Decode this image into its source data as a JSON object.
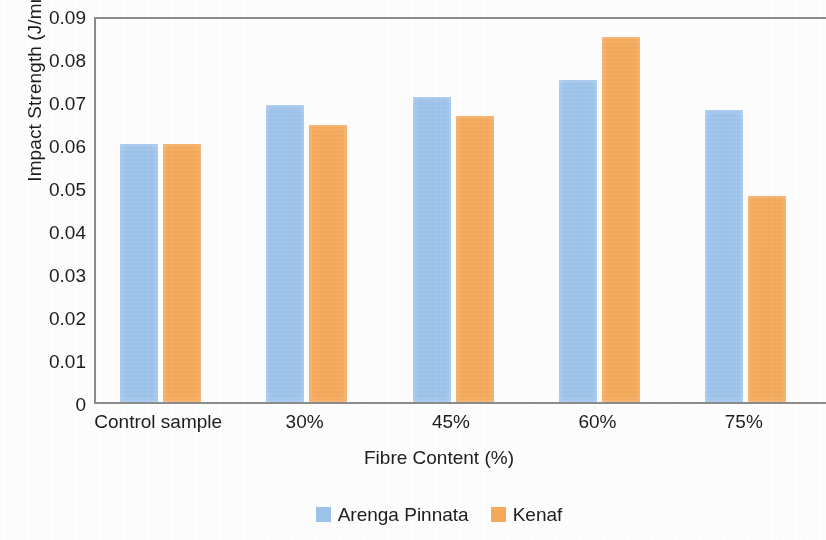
{
  "chart_data": {
    "type": "bar",
    "title": "",
    "xlabel": "Fibre Content (%)",
    "ylabel": "Impact Strength (J/mm2)",
    "categories": [
      "Control sample",
      "30%",
      "45%",
      "60%",
      "75%"
    ],
    "series": [
      {
        "name": "Arenga Pinnata",
        "color": "#9dc3eb",
        "values": [
          0.06,
          0.069,
          0.071,
          0.075,
          0.068
        ]
      },
      {
        "name": "Kenaf",
        "color": "#f4a95c",
        "values": [
          0.06,
          0.0645,
          0.0665,
          0.085,
          0.048
        ]
      }
    ],
    "ylim": [
      0,
      0.09
    ],
    "ytick_step": 0.01,
    "ytick_labels": [
      "0.09",
      "0.08",
      "0.07",
      "0.06",
      "0.05",
      "0.04",
      "0.03",
      "0.02",
      "0.01",
      "0"
    ],
    "ytick_values": [
      0.09,
      0.08,
      0.07,
      0.06,
      0.05,
      0.04,
      0.03,
      0.02,
      0.01,
      0
    ],
    "grid": false,
    "legend_position": "bottom",
    "axis_color": "#8c8c8c",
    "background_color": "#fdfdfd"
  }
}
